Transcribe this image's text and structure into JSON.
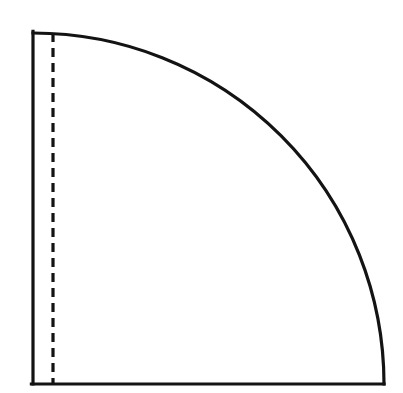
{
  "figure": {
    "canvas": {
      "width": 403,
      "height": 393
    },
    "background_color": "#ffffff",
    "line_color": "#131313",
    "geometry": {
      "center_x": 33,
      "center_y": 384,
      "radius": 351,
      "arc_start_x": 33,
      "arc_start_y": 33,
      "arc_end_x": 384,
      "arc_end_y": 384,
      "sweep_degrees": 90,
      "orientation": "quadrant-opening-up-right"
    },
    "elements": {
      "sector_region": {
        "name": "quarter-circle-sector",
        "fill": "#ffffff",
        "stroke_width": 3.2
      },
      "vertical_radius": {
        "name": "left-vertical-radius",
        "style": "solid",
        "x": 33,
        "y_top": 33,
        "y_bottom": 384,
        "length": 351
      },
      "horizontal_radius": {
        "name": "bottom-horizontal-radius",
        "style": "solid",
        "y": 384,
        "x_left": 33,
        "x_right": 384,
        "length": 351
      },
      "arc": {
        "name": "quarter-arc",
        "style": "solid",
        "stroke_width": 3.2
      },
      "dashed_chord": {
        "name": "dashed-vertical-chord",
        "style": "dashed",
        "x": 53,
        "y_top": 33,
        "y_bottom": 384,
        "dash_length": 9,
        "gap_length": 6,
        "stroke_width": 3.2
      }
    }
  }
}
